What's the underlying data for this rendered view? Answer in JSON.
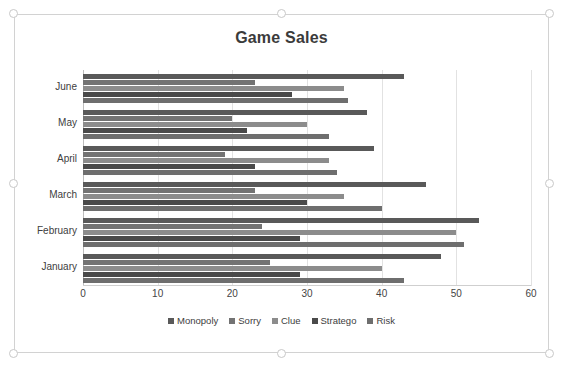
{
  "chart_object": {
    "selected": true,
    "handles": [
      "top-left",
      "top-center",
      "top-right",
      "middle-left",
      "middle-right",
      "bottom-left",
      "bottom-center",
      "bottom-right"
    ]
  },
  "chart_data": {
    "type": "bar",
    "orientation": "horizontal",
    "grouping": "clustered",
    "title": "Game Sales",
    "xlabel": "",
    "ylabel": "",
    "xlim": [
      0,
      60
    ],
    "xticks": [
      0,
      10,
      20,
      30,
      40,
      50,
      60
    ],
    "grid": true,
    "legend_position": "bottom",
    "categories": [
      "June",
      "May",
      "April",
      "March",
      "February",
      "January"
    ],
    "series": [
      {
        "name": "Monopoly",
        "color": "#595959",
        "values": [
          43,
          38,
          39,
          46,
          53,
          48
        ]
      },
      {
        "name": "Sorry",
        "color": "#737373",
        "values": [
          23,
          20,
          19,
          23,
          24,
          25
        ]
      },
      {
        "name": "Clue",
        "color": "#8c8c8c",
        "values": [
          35,
          30,
          33,
          35,
          50,
          40
        ]
      },
      {
        "name": "Stratego",
        "color": "#4a4a4a",
        "values": [
          28,
          22,
          23,
          30,
          29,
          29
        ]
      },
      {
        "name": "Risk",
        "color": "#6e6e6e",
        "values": [
          35.5,
          33,
          34,
          40,
          51,
          43
        ]
      }
    ]
  }
}
